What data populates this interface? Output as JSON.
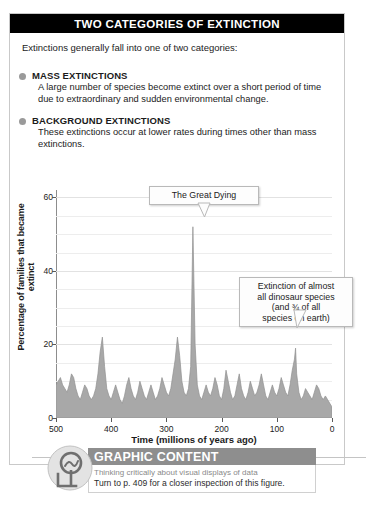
{
  "ghost_bleed": {
    "line1": "",
    "line2": ""
  },
  "card": {
    "header_title": "TWO CATEGORIES OF EXTINCTION",
    "intro": "Extinctions generally fall into one of two categories:",
    "categories": [
      {
        "bullet_icon": "filled-circle-bullet-icon",
        "title": "MASS EXTINCTIONS",
        "body": "A large number of species become extinct over a short period of time due to extraordinary and sudden environmental change."
      },
      {
        "bullet_icon": "filled-circle-bullet-icon",
        "title": "BACKGROUND EXTINCTIONS",
        "body": "These extinctions occur at lower rates during times other than mass extinctions."
      }
    ]
  },
  "annotations": {
    "great_dying": "The Great Dying",
    "dinosaur": "Extinction of almost all dinosaur species (and ¾ of all species on earth)",
    "dinosaur_lines": [
      "Extinction of almost",
      "all dinosaur species",
      "(and ¾ of all",
      "species on earth)"
    ]
  },
  "footer": {
    "banner_title": "GRAPHIC CONTENT",
    "subtitle": "Thinking critically about visual displays of data",
    "line": "Turn to p. 409 for a closer inspection of this figure.",
    "icon": "magnifier-chart-icon"
  },
  "colors": {
    "header_bg": "#000000",
    "header_text": "#ffffff",
    "area_fill": "#a8a8a8",
    "area_stroke": "#909090",
    "bullet": "#9a9a9a",
    "banner_bg": "#8e8e8e",
    "grid": "#ededed",
    "axis": "#5a5a5a",
    "card_border": "#c9c9c9"
  },
  "chart_data": {
    "type": "area",
    "title": "",
    "xlabel": "Time  (millions of years ago)",
    "ylabel": "Percentage of families that became extinct",
    "xlim": [
      500,
      0
    ],
    "ylim": [
      0,
      62
    ],
    "x_reversed": true,
    "grid": true,
    "legend": null,
    "xticks": [
      500,
      400,
      300,
      200,
      100,
      0
    ],
    "yticks": [
      0,
      20,
      40,
      60
    ],
    "minor_y_gridlines": [
      5,
      10,
      15,
      25,
      30,
      35,
      45,
      50,
      55
    ],
    "units": {
      "x": "millions of years ago",
      "y": "percent of families"
    },
    "annotated_points": [
      {
        "label": "The Great Dying",
        "x": 252,
        "y": 52
      },
      {
        "label": "Extinction of almost all dinosaur species (and ¾ of all species on earth)",
        "x": 66,
        "y": 19
      }
    ],
    "x": [
      500,
      496,
      492,
      488,
      484,
      480,
      476,
      472,
      468,
      464,
      460,
      456,
      452,
      448,
      444,
      440,
      436,
      432,
      428,
      424,
      420,
      416,
      412,
      408,
      404,
      400,
      396,
      392,
      388,
      384,
      380,
      376,
      372,
      368,
      364,
      360,
      356,
      352,
      348,
      344,
      340,
      336,
      332,
      328,
      324,
      320,
      316,
      312,
      308,
      304,
      300,
      296,
      292,
      288,
      284,
      280,
      276,
      272,
      268,
      264,
      260,
      256,
      252,
      248,
      244,
      240,
      236,
      232,
      228,
      224,
      220,
      216,
      212,
      208,
      204,
      200,
      196,
      192,
      188,
      184,
      180,
      176,
      172,
      168,
      164,
      160,
      156,
      152,
      148,
      144,
      140,
      136,
      132,
      128,
      124,
      120,
      116,
      112,
      108,
      104,
      100,
      96,
      92,
      88,
      84,
      80,
      76,
      72,
      68,
      66,
      64,
      60,
      56,
      52,
      48,
      44,
      40,
      36,
      32,
      28,
      24,
      20,
      16,
      12,
      8,
      4,
      0
    ],
    "y": [
      9,
      10,
      11,
      9,
      8,
      7,
      9,
      12,
      11,
      8,
      6,
      5,
      7,
      9,
      8,
      6,
      5,
      6,
      8,
      12,
      18,
      22,
      14,
      8,
      6,
      5,
      7,
      9,
      7,
      5,
      4,
      6,
      9,
      11,
      8,
      6,
      5,
      7,
      10,
      8,
      6,
      5,
      7,
      9,
      7,
      5,
      6,
      8,
      11,
      9,
      7,
      6,
      8,
      12,
      16,
      22,
      17,
      10,
      7,
      6,
      8,
      14,
      52,
      20,
      9,
      6,
      5,
      7,
      9,
      7,
      6,
      8,
      11,
      9,
      6,
      5,
      8,
      13,
      10,
      7,
      5,
      6,
      9,
      12,
      8,
      6,
      5,
      7,
      10,
      8,
      6,
      7,
      9,
      12,
      9,
      6,
      5,
      7,
      9,
      7,
      6,
      8,
      11,
      9,
      7,
      6,
      9,
      13,
      16,
      19,
      12,
      7,
      5,
      6,
      8,
      7,
      6,
      5,
      7,
      9,
      8,
      6,
      5,
      6,
      5,
      4,
      3
    ]
  }
}
